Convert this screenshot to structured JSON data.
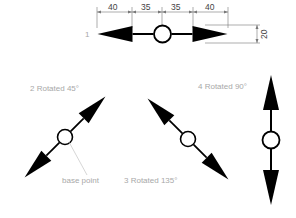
{
  "diagram": {
    "dimensions": {
      "segments": [
        "40",
        "35",
        "35",
        "40"
      ],
      "height": "20"
    },
    "labels": {
      "item1": "1",
      "item2": "2 Rotated 45°",
      "item3": "3 Rotated 135°",
      "item4": "4 Rotated 90°",
      "base_point": "base point"
    },
    "colors": {
      "shape": "#000000",
      "label": "#a8a8a8",
      "dimension": "#666666"
    }
  }
}
